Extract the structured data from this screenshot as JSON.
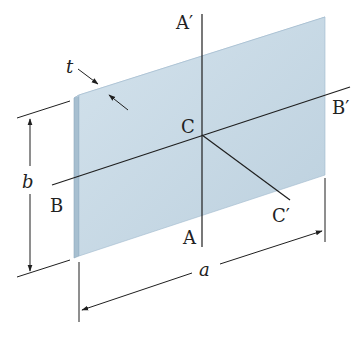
{
  "figure": {
    "type": "rectangular-plate-dimension-diagram",
    "colors": {
      "plate_face": "#c9dbe6",
      "plate_face_shade": "#b9cddb",
      "plate_edge": "#9fb9cc",
      "plate_edge_light": "#dbe8f0",
      "line": "#1f1f1f",
      "background": "#ffffff"
    },
    "labels": {
      "thickness": "t",
      "height": "b",
      "width": "a",
      "center": "C",
      "axis_a_bottom": "A",
      "axis_a_top": "A′",
      "axis_b_left": "B",
      "axis_b_right": "B′",
      "axis_c_end": "C′"
    }
  }
}
